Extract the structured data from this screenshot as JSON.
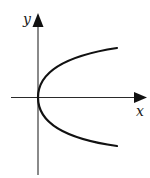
{
  "diagram": {
    "axes": {
      "x_label": "x",
      "y_label": "y",
      "x_axis": {
        "from": [
          11,
          97.5
        ],
        "to": [
          147,
          97.5
        ]
      },
      "y_axis": {
        "from": [
          38,
          175
        ],
        "to": [
          38,
          14
        ]
      }
    },
    "curve": {
      "type": "parabola",
      "equation_form": "x = a*y^2",
      "vertex": [
        38,
        97.5
      ],
      "upper_end": [
        117,
        48
      ],
      "lower_end": [
        117,
        146
      ]
    },
    "colors": {
      "background": "#ffffff",
      "axis": "#2a2a2a",
      "curve": "#111111",
      "label": "#1a1a1a"
    }
  }
}
